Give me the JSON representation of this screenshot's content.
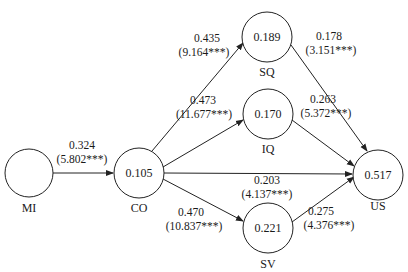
{
  "diagram": {
    "type": "structural-equation-model",
    "nodes": [
      {
        "id": "MI",
        "label": "MI",
        "value": ""
      },
      {
        "id": "CO",
        "label": "CO",
        "value": "0.105"
      },
      {
        "id": "SQ",
        "label": "SQ",
        "value": "0.189"
      },
      {
        "id": "IQ",
        "label": "IQ",
        "value": "0.170"
      },
      {
        "id": "SV",
        "label": "SV",
        "value": "0.221"
      },
      {
        "id": "US",
        "label": "US",
        "value": "0.517"
      }
    ],
    "edges": [
      {
        "from": "MI",
        "to": "CO",
        "coef": "0.324",
        "t": "(5.802***)"
      },
      {
        "from": "CO",
        "to": "SQ",
        "coef": "0.435",
        "t": "(9.164***)"
      },
      {
        "from": "CO",
        "to": "IQ",
        "coef": "0.473",
        "t": "(11.677***)"
      },
      {
        "from": "CO",
        "to": "US",
        "coef": "0.203",
        "t": "(4.137***)"
      },
      {
        "from": "CO",
        "to": "SV",
        "coef": "0.470",
        "t": "(10.837***)"
      },
      {
        "from": "SQ",
        "to": "US",
        "coef": "0.178",
        "t": "(3.151***)"
      },
      {
        "from": "IQ",
        "to": "US",
        "coef": "0.263",
        "t": "(5.372***)"
      },
      {
        "from": "SV",
        "to": "US",
        "coef": "0.275",
        "t": "(4.376***)"
      }
    ]
  }
}
